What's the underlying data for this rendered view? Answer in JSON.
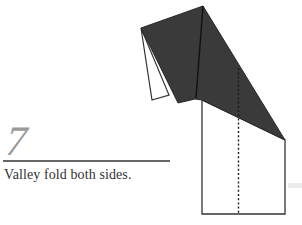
{
  "step": {
    "number": "7",
    "instruction": "Valley fold both sides."
  },
  "diagram": {
    "fill_dark": "#3a3a3a",
    "stroke": "#333333",
    "paper": "#ffffff",
    "fold_type": "valley",
    "annotations": [
      "dotted valley-fold line"
    ]
  }
}
